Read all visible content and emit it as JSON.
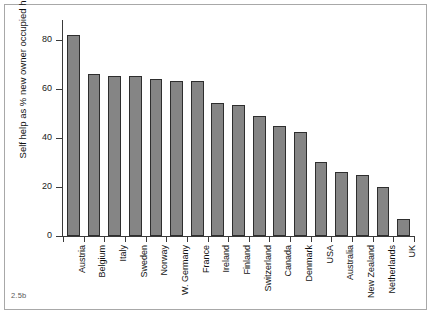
{
  "figure": {
    "caption": "2.5b"
  },
  "chart_data": {
    "type": "bar",
    "title": "",
    "subtitle": "",
    "xlabel": "",
    "ylabel": "Self help as % new owner occupied housing",
    "ylim": [
      0,
      88
    ],
    "yticks": [
      0,
      20,
      40,
      60,
      80
    ],
    "ytick_labels": [
      "0",
      "20",
      "40",
      "60",
      "80"
    ],
    "grid": false,
    "legend": null,
    "bar_color": "#858585",
    "bar_edge_color": "#2e2e2e",
    "axis_color": "#3a3a3a",
    "categories": [
      "Austria",
      "Belgium",
      "Italy",
      "Sweden",
      "Norway",
      "W. Germany",
      "France",
      "Ireland",
      "Finland",
      "Switzerland",
      "Canada",
      "Denmark",
      "USA",
      "Australia",
      "New Zealand",
      "Netherlands",
      "UK"
    ],
    "values": [
      82,
      66,
      65,
      65,
      64,
      63,
      63,
      54,
      53.5,
      49,
      45,
      42.5,
      30,
      26,
      25,
      20,
      7
    ]
  }
}
